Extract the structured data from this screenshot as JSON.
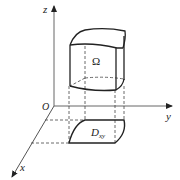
{
  "figure": {
    "axes": {
      "x_label": "x",
      "y_label": "y",
      "z_label": "z",
      "origin_label": "O"
    },
    "solid_label": "Ω",
    "region_label_main": "D",
    "region_label_sub": "xy",
    "colors": {
      "axis": "#555555",
      "solid": "#222222",
      "dashed": "#333333",
      "background": "#ffffff"
    }
  }
}
